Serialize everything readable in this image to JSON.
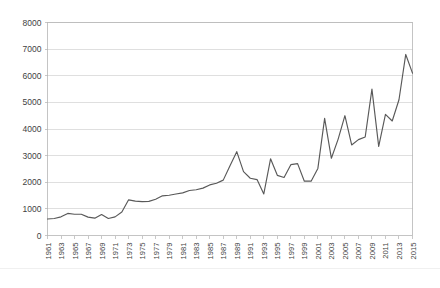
{
  "chart_data": {
    "type": "line",
    "title": "",
    "subtitle": "",
    "xlabel": "",
    "ylabel": "",
    "legend": [],
    "legend_position": "none",
    "grid": true,
    "grid_axis": "y",
    "xlim": [
      1961,
      2015
    ],
    "ylim": [
      0,
      8000
    ],
    "ytick_labels": [
      "8000",
      "7000",
      "6000",
      "5000",
      "4000",
      "3000",
      "2000",
      "1000",
      "0"
    ],
    "ytick_values": [
      8000,
      7000,
      6000,
      5000,
      4000,
      3000,
      2000,
      1000,
      0
    ],
    "xtick_labels": [
      "1961",
      "1963",
      "1965",
      "1967",
      "1969",
      "1971",
      "1973",
      "1975",
      "1977",
      "1979",
      "1981",
      "1983",
      "1985",
      "1987",
      "1989",
      "1991",
      "1993",
      "1995",
      "1997",
      "1999",
      "2001",
      "2003",
      "2005",
      "2007",
      "2009",
      "2011",
      "2013",
      "2015"
    ],
    "x": [
      1961,
      1962,
      1963,
      1964,
      1965,
      1966,
      1967,
      1968,
      1969,
      1970,
      1971,
      1972,
      1973,
      1974,
      1975,
      1976,
      1977,
      1978,
      1979,
      1980,
      1981,
      1982,
      1983,
      1984,
      1985,
      1986,
      1987,
      1988,
      1989,
      1990,
      1991,
      1992,
      1993,
      1994,
      1995,
      1996,
      1997,
      1998,
      1999,
      2000,
      2001,
      2002,
      2003,
      2004,
      2005,
      2006,
      2007,
      2008,
      2009,
      2010,
      2011,
      2012,
      2013,
      2014,
      2015
    ],
    "values": [
      620,
      640,
      700,
      830,
      800,
      800,
      690,
      650,
      790,
      640,
      700,
      880,
      1340,
      1290,
      1270,
      1280,
      1360,
      1490,
      1510,
      1560,
      1600,
      1690,
      1720,
      1780,
      1900,
      1960,
      2080,
      2620,
      3150,
      2400,
      2150,
      2100,
      1560,
      2880,
      2260,
      2180,
      2660,
      2700,
      2040,
      2040,
      2520,
      4400,
      2900,
      3620,
      4500,
      3400,
      3600,
      3700,
      5500,
      3350,
      4550,
      4300,
      5100,
      6800,
      6100
    ],
    "series": [
      {
        "name": "series-1",
        "color": "#595959",
        "values": [
          620,
          640,
          700,
          830,
          800,
          800,
          690,
          650,
          790,
          640,
          700,
          880,
          1340,
          1290,
          1270,
          1280,
          1360,
          1490,
          1510,
          1560,
          1600,
          1690,
          1720,
          1780,
          1900,
          1960,
          2080,
          2620,
          3150,
          2400,
          2150,
          2100,
          1560,
          2880,
          2260,
          2180,
          2660,
          2700,
          2040,
          2040,
          2520,
          4400,
          2900,
          3620,
          4500,
          3400,
          3600,
          3700,
          5500,
          3350,
          4550,
          4300,
          5100,
          6800,
          6100
        ]
      }
    ]
  },
  "footer": {
    "note": ""
  },
  "colors": {
    "line": "#595959",
    "grid": "#d2d2d2",
    "frame": "#b5b5b5",
    "text": "#3f3f3f",
    "background": "#ffffff"
  }
}
